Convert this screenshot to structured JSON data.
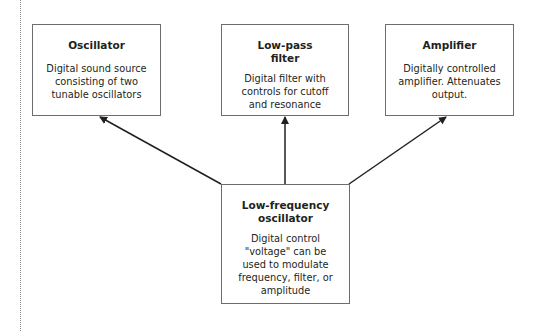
{
  "diagram": {
    "type": "block-diagram",
    "nodes": [
      {
        "id": "oscillator",
        "title": "Oscillator",
        "description_lines": [
          "Digital sound source",
          "consisting of two",
          "tunable oscillators"
        ]
      },
      {
        "id": "lowpass",
        "title_lines": [
          "Low-pass",
          "filter"
        ],
        "description_lines": [
          "Digital filter with",
          "controls for cutoff",
          "and resonance"
        ]
      },
      {
        "id": "amplifier",
        "title": "Amplifier",
        "description_lines": [
          "Digitally controlled",
          "amplifier. Attenuates",
          "output."
        ]
      },
      {
        "id": "lfo",
        "title_lines": [
          "Low-frequency",
          "oscillator"
        ],
        "description_lines": [
          "Digital control",
          "\"voltage\" can be",
          "used to modulate",
          "frequency, filter, or",
          "amplitude"
        ]
      }
    ],
    "edges": [
      {
        "from": "lfo",
        "to": "oscillator"
      },
      {
        "from": "lfo",
        "to": "lowpass"
      },
      {
        "from": "lfo",
        "to": "amplifier"
      }
    ],
    "colors": {
      "box_border": "#6d6d6d",
      "arrow": "#231f20",
      "text": "#231f20",
      "background": "#ffffff"
    }
  }
}
